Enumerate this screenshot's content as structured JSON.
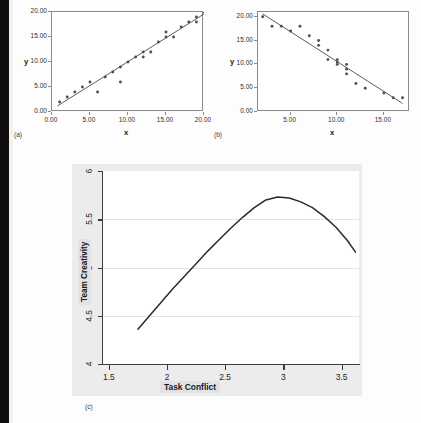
{
  "figure": {
    "panel_labels": {
      "a": "(a)",
      "b": "(b)",
      "c": "(c)"
    }
  },
  "chart_data": [
    {
      "id": "panel-a",
      "type": "scatter",
      "title": "",
      "panel_label": "(a)",
      "xlabel": "x",
      "ylabel": "y",
      "xlim": [
        0,
        20
      ],
      "ylim": [
        0,
        20
      ],
      "xticks": [
        0,
        5,
        10,
        15,
        20
      ],
      "xticklabels": [
        "0.00",
        "5.00",
        "10.00",
        "15.00",
        "20.00"
      ],
      "yticks": [
        0,
        5,
        10,
        15,
        20
      ],
      "yticklabels": [
        "0.00",
        "5.00",
        "10.00",
        "15.00",
        "20.00"
      ],
      "grid": false,
      "legend": null,
      "annotation": "Positive linear relationship with fitted regression line",
      "points": [
        [
          1,
          2
        ],
        [
          2,
          3
        ],
        [
          3,
          4
        ],
        [
          4,
          5
        ],
        [
          5,
          6
        ],
        [
          6,
          4
        ],
        [
          7,
          7
        ],
        [
          8,
          8
        ],
        [
          9,
          6
        ],
        [
          9,
          9
        ],
        [
          10,
          10
        ],
        [
          11,
          11
        ],
        [
          12,
          12
        ],
        [
          12,
          11
        ],
        [
          13,
          12
        ],
        [
          14,
          14
        ],
        [
          15,
          16
        ],
        [
          15,
          15
        ],
        [
          16,
          15
        ],
        [
          17,
          17
        ],
        [
          18,
          18
        ],
        [
          19,
          19
        ],
        [
          19,
          18
        ],
        [
          20,
          20
        ]
      ],
      "fit_line": {
        "x0": 0.7,
        "y0": 1.2,
        "x1": 20.0,
        "y1": 19.6
      }
    },
    {
      "id": "panel-b",
      "type": "scatter",
      "title": "",
      "panel_label": "(b)",
      "xlabel": "x",
      "ylabel": "y",
      "xlim": [
        1.5,
        17.8
      ],
      "ylim": [
        0,
        21
      ],
      "xticks": [
        5,
        10,
        15
      ],
      "xticklabels": [
        "5.00",
        "10.00",
        "15.00"
      ],
      "yticks": [
        0,
        5,
        10,
        15,
        20
      ],
      "yticklabels": [
        "0.00",
        "5.00",
        "10.00",
        "15.00",
        "20.00"
      ],
      "grid": false,
      "legend": null,
      "annotation": "Negative linear relationship with fitted regression line",
      "points": [
        [
          2,
          20
        ],
        [
          3,
          18
        ],
        [
          4,
          18
        ],
        [
          5,
          17
        ],
        [
          6,
          18
        ],
        [
          7,
          16
        ],
        [
          8,
          15
        ],
        [
          8,
          14
        ],
        [
          9,
          13
        ],
        [
          9,
          11
        ],
        [
          10,
          11
        ],
        [
          10,
          10
        ],
        [
          10,
          10.5
        ],
        [
          11,
          10
        ],
        [
          11,
          9
        ],
        [
          11,
          8
        ],
        [
          12,
          6
        ],
        [
          13,
          5
        ],
        [
          15,
          4
        ],
        [
          16,
          3
        ],
        [
          17,
          3
        ]
      ],
      "fit_line": {
        "x0": 2.0,
        "y0": 20.6,
        "x1": 17.0,
        "y1": 1.8
      }
    },
    {
      "id": "panel-c",
      "type": "line",
      "title": "",
      "panel_label": "(c)",
      "xlabel": "Task Conflict",
      "ylabel": "Team Creativity",
      "xlim": [
        1.45,
        3.65
      ],
      "ylim": [
        4,
        6
      ],
      "xticks": [
        1.5,
        2,
        2.5,
        3,
        3.5
      ],
      "xticklabels": [
        "1.5",
        "2",
        "2.5",
        "3",
        "3.5"
      ],
      "yticks": [
        4,
        4.5,
        5,
        5.5,
        6
      ],
      "yticklabels": [
        "4",
        "4.5",
        "5",
        "5.5",
        "6"
      ],
      "grid": true,
      "legend": null,
      "annotation": "Inverted U-shaped (curvilinear) relationship peaking near Task Conflict = 2.85",
      "x": [
        1.75,
        1.85,
        1.95,
        2.05,
        2.15,
        2.25,
        2.35,
        2.45,
        2.55,
        2.65,
        2.75,
        2.85,
        2.95,
        3.05,
        3.15,
        3.25,
        3.35,
        3.45,
        3.55,
        3.62
      ],
      "y": [
        4.36,
        4.5,
        4.64,
        4.78,
        4.91,
        5.04,
        5.17,
        5.29,
        5.41,
        5.52,
        5.62,
        5.7,
        5.73,
        5.72,
        5.68,
        5.62,
        5.53,
        5.42,
        5.28,
        5.16
      ]
    }
  ]
}
